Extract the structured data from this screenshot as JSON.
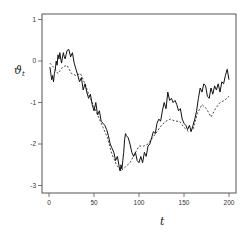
{
  "chart_data": {
    "type": "line",
    "title": "",
    "xlabel": "t",
    "ylabel": "ϑ_t",
    "ylabel_main": "ϑ",
    "ylabel_sub": "t",
    "xlim": [
      -4,
      208
    ],
    "ylim": [
      -3.2,
      1.15
    ],
    "xticks": [
      0,
      50,
      100,
      150,
      200
    ],
    "yticks": [
      1,
      0,
      -1,
      -2,
      -3
    ],
    "xtick_labels": [
      "0",
      "50",
      "100",
      "150",
      "200"
    ],
    "ytick_labels": [
      "1",
      "0",
      "-1",
      "-2",
      "-3"
    ],
    "grid": false,
    "legend": null,
    "series": [
      {
        "name": "observed",
        "style": "solid",
        "color": "#111111",
        "x": [
          1,
          2,
          3,
          4,
          5,
          6,
          7,
          8,
          9,
          10,
          11,
          12,
          13,
          14,
          15,
          16,
          17,
          18,
          19,
          20,
          22,
          24,
          26,
          28,
          30,
          32,
          34,
          36,
          38,
          40,
          42,
          44,
          46,
          48,
          50,
          52,
          54,
          56,
          58,
          60,
          62,
          64,
          66,
          68,
          70,
          72,
          74,
          76,
          78,
          79,
          80,
          81,
          82,
          83,
          84,
          85,
          86,
          88,
          90,
          92,
          94,
          96,
          98,
          100,
          102,
          104,
          106,
          108,
          110,
          112,
          114,
          116,
          118,
          120,
          122,
          124,
          126,
          128,
          130,
          132,
          134,
          136,
          138,
          140,
          142,
          144,
          146,
          148,
          150,
          152,
          154,
          156,
          158,
          160,
          162,
          164,
          166,
          168,
          170,
          172,
          174,
          176,
          178,
          180,
          182,
          184,
          186,
          188,
          190,
          192,
          194,
          196,
          198,
          200
        ],
        "values": [
          -0.15,
          -0.3,
          -0.45,
          -0.35,
          -0.5,
          -0.3,
          -0.2,
          0.0,
          -0.1,
          0.15,
          0.05,
          0.2,
          0.05,
          -0.05,
          0.1,
          0.2,
          0.1,
          0.05,
          0.15,
          0.25,
          0.28,
          0.1,
          0.2,
          -0.05,
          -0.2,
          -0.35,
          -0.5,
          -0.4,
          -0.7,
          -0.55,
          -0.75,
          -0.9,
          -0.8,
          -1.05,
          -1.2,
          -1.0,
          -1.3,
          -1.2,
          -1.45,
          -1.5,
          -1.55,
          -1.65,
          -1.8,
          -2.0,
          -2.1,
          -2.2,
          -2.4,
          -2.3,
          -2.55,
          -2.65,
          -2.5,
          -2.6,
          -2.4,
          -2.2,
          -1.9,
          -1.75,
          -1.8,
          -1.85,
          -2.0,
          -2.2,
          -2.3,
          -2.2,
          -2.4,
          -2.45,
          -2.3,
          -2.45,
          -2.2,
          -2.3,
          -2.05,
          -2.0,
          -1.85,
          -1.7,
          -1.75,
          -1.5,
          -1.4,
          -1.45,
          -1.2,
          -1.0,
          -1.15,
          -0.75,
          -0.95,
          -0.9,
          -1.0,
          -0.95,
          -1.05,
          -1.2,
          -1.15,
          -1.4,
          -1.5,
          -1.55,
          -1.65,
          -1.55,
          -1.7,
          -1.55,
          -1.4,
          -1.2,
          -0.9,
          -0.65,
          -0.75,
          -0.55,
          -0.6,
          -0.85,
          -0.9,
          -0.65,
          -0.8,
          -0.6,
          -0.7,
          -0.55,
          -0.75,
          -0.5,
          -0.55,
          -0.35,
          -0.2,
          -0.45
        ]
      },
      {
        "name": "smoothed",
        "style": "dashed",
        "color": "#333333",
        "x": [
          1,
          5,
          10,
          15,
          20,
          25,
          30,
          35,
          40,
          45,
          50,
          55,
          60,
          65,
          70,
          75,
          80,
          85,
          90,
          95,
          100,
          105,
          110,
          115,
          120,
          125,
          130,
          135,
          140,
          145,
          150,
          155,
          160,
          165,
          170,
          175,
          180,
          185,
          190,
          195,
          200
        ],
        "values": [
          -0.05,
          -0.15,
          -0.3,
          -0.15,
          -0.1,
          -0.3,
          -0.35,
          -0.3,
          -0.55,
          -0.85,
          -1.1,
          -1.35,
          -1.6,
          -1.85,
          -2.25,
          -2.5,
          -2.65,
          -2.55,
          -2.45,
          -2.25,
          -2.05,
          -2.05,
          -2.0,
          -1.85,
          -1.7,
          -1.55,
          -1.45,
          -1.4,
          -1.45,
          -1.45,
          -1.6,
          -1.7,
          -1.65,
          -1.25,
          -1.05,
          -1.15,
          -1.35,
          -1.15,
          -1.0,
          -0.95,
          -0.85
        ]
      }
    ]
  }
}
